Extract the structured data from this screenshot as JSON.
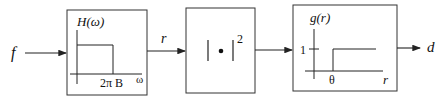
{
  "diagram": {
    "input_signal": "f",
    "intermediate_signal": "r",
    "output_signal": "d",
    "blocks": [
      {
        "name": "lowpass-filter",
        "function_label": "H(ω)",
        "x_axis_label": "ω",
        "cutoff_label": "2π B"
      },
      {
        "name": "magnitude-squared",
        "operator_label": "|•|",
        "exponent": "2"
      },
      {
        "name": "threshold",
        "function_label": "g(r)",
        "x_axis_label": "r",
        "y_tick_label": "1",
        "threshold_label": "θ"
      }
    ]
  }
}
